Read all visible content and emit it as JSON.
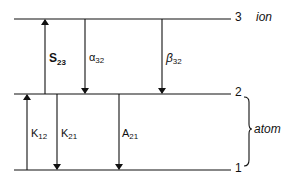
{
  "diagram": {
    "levels": [
      {
        "id": "3",
        "label": "3",
        "group": "ion"
      },
      {
        "id": "2",
        "label": "2",
        "group": "atom"
      },
      {
        "id": "1",
        "label": "1",
        "group": "atom"
      }
    ],
    "groups": {
      "ion": "ion",
      "atom": "atom"
    },
    "transitions": [
      {
        "name": "S",
        "sub": "23",
        "from": "2",
        "to": "3",
        "direction": "up"
      },
      {
        "name": "α",
        "sub": "32",
        "from": "3",
        "to": "2",
        "direction": "down"
      },
      {
        "name": "β",
        "sub": "32",
        "from": "3",
        "to": "2",
        "direction": "down"
      },
      {
        "name": "K",
        "sub": "12",
        "from": "1",
        "to": "2",
        "direction": "up"
      },
      {
        "name": "K",
        "sub": "21",
        "from": "2",
        "to": "1",
        "direction": "down"
      },
      {
        "name": "A",
        "sub": "21",
        "from": "2",
        "to": "1",
        "direction": "down"
      }
    ],
    "colors": {
      "ink": "#111111",
      "background": "#ffffff"
    }
  }
}
